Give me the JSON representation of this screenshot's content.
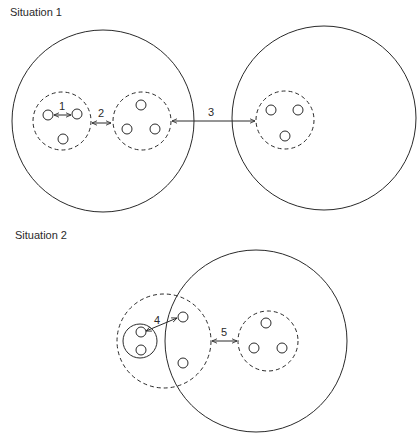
{
  "situation1": {
    "title": "Situation 1",
    "labels": {
      "d1": "1",
      "d2": "2",
      "d3": "3"
    }
  },
  "situation2": {
    "title": "Situation 2",
    "labels": {
      "d4": "4",
      "d5": "5"
    }
  }
}
